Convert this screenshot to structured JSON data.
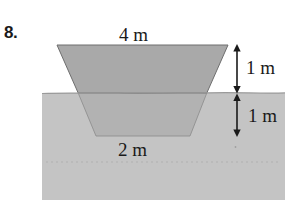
{
  "problem": {
    "number": "8."
  },
  "figure": {
    "name": "trapezoidal-channel-cross-section",
    "labels": {
      "top_width": "4 m",
      "bottom_width": "2 m",
      "height_above_ground": "1 m",
      "height_below_ground": "1 m"
    },
    "colors": {
      "trapezoid_fill": "#a9a9a9",
      "trapezoid_fill_submerged": "#b0b0b0",
      "ground_fill": "#c4c4c4",
      "outline": "#6e6e6e",
      "arrow": "#1a1a1a",
      "dotted_line": "#b8b8b8",
      "background": "#ffffff"
    },
    "geometry": {
      "trapezoid_top_left_x": 57,
      "trapezoid_top_right_x": 228,
      "trapezoid_top_y": 45,
      "trapezoid_bottom_left_x": 96,
      "trapezoid_bottom_right_x": 190,
      "trapezoid_bottom_y": 136,
      "ground_line_y": 93,
      "ground_rect_left": 42,
      "ground_rect_right": 285,
      "ground_rect_bottom": 200,
      "dotted_line_y": 162,
      "arrow_x": 237
    }
  }
}
